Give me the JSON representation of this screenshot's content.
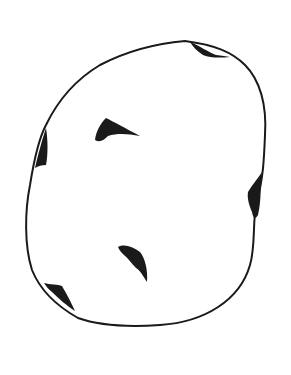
{
  "drawing": {
    "subject": "potato-outline",
    "stroke_color": "#1a1a1a",
    "background": "#ffffff",
    "eyes": [
      "top-right-eye",
      "left-eye",
      "right-eye",
      "bottom-left-eye",
      "inner-upper-eye",
      "inner-lower-eye"
    ]
  }
}
